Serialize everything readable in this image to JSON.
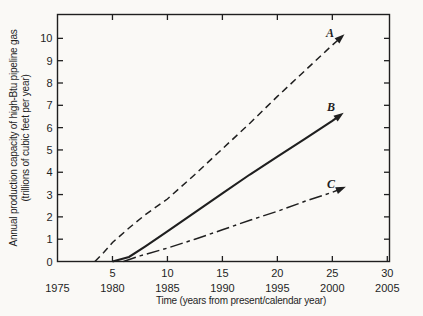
{
  "figure": {
    "background": "#faf9f6",
    "ink": "#1f1f1f"
  },
  "chart_data": {
    "type": "line",
    "title": "",
    "xlabel": "Time (years from present/calendar year)",
    "ylabel_line1": "Annual production capacity of high-Btu pipeline gas",
    "ylabel_line2": "(trillions of cubic feet per year)",
    "xlim": [
      0,
      30.2
    ],
    "ylim": [
      0,
      11.07
    ],
    "grid": "off",
    "legend": "none (curves labeled A, B, C at line ends with arrowheads)",
    "x_ticks_bottom": [
      5,
      10,
      15,
      20,
      25,
      30
    ],
    "x_ticks_top": [
      5,
      10,
      15,
      20,
      25
    ],
    "y_ticks": [
      0,
      1,
      2,
      3,
      4,
      5,
      6,
      7,
      8,
      9,
      10
    ],
    "y_ticks_right": [
      1,
      2,
      3,
      4,
      5,
      6,
      7,
      8,
      9,
      10
    ],
    "calendar_axis": {
      "labels": [
        "1975",
        "1980",
        "1985",
        "1990",
        "1995",
        "2000",
        "2005"
      ],
      "positions": [
        0,
        5,
        10,
        15,
        20,
        25,
        30
      ]
    },
    "series": [
      {
        "name": "A",
        "line_style": "dashed",
        "ends_with_arrow": true,
        "points": [
          [
            3.4,
            0
          ],
          [
            4.2,
            0.4
          ],
          [
            5,
            0.85
          ],
          [
            6.5,
            1.5
          ],
          [
            8,
            2.1
          ],
          [
            10,
            2.8
          ],
          [
            12.5,
            3.9
          ],
          [
            15,
            5.05
          ],
          [
            17.5,
            6.2
          ],
          [
            20,
            7.4
          ],
          [
            22.5,
            8.55
          ],
          [
            25,
            9.7
          ],
          [
            25.8,
            10.05
          ]
        ]
      },
      {
        "name": "B",
        "line_style": "solid",
        "ends_with_arrow": true,
        "points": [
          [
            5,
            0
          ],
          [
            6.5,
            0.2
          ],
          [
            8,
            0.68
          ],
          [
            10,
            1.35
          ],
          [
            12.5,
            2.2
          ],
          [
            15,
            3.05
          ],
          [
            17.5,
            3.9
          ],
          [
            20,
            4.7
          ],
          [
            22.5,
            5.5
          ],
          [
            25,
            6.3
          ],
          [
            25.7,
            6.55
          ]
        ]
      },
      {
        "name": "C",
        "line_style": "long-dash",
        "ends_with_arrow": true,
        "points": [
          [
            6,
            0
          ],
          [
            7.5,
            0.25
          ],
          [
            10,
            0.6
          ],
          [
            12.5,
            1.0
          ],
          [
            15,
            1.42
          ],
          [
            17.5,
            1.85
          ],
          [
            20,
            2.25
          ],
          [
            22.5,
            2.7
          ],
          [
            25,
            3.1
          ],
          [
            25.85,
            3.27
          ]
        ]
      }
    ]
  }
}
